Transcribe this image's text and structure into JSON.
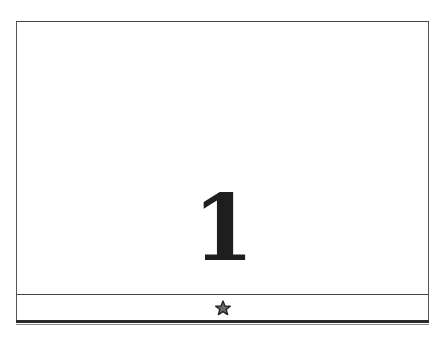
{
  "card": {
    "number": "1",
    "footer_icon": "star-icon"
  },
  "colors": {
    "border": "#444444",
    "number": "#1e1e1e",
    "star_fill": "#666666",
    "star_stroke": "#222222"
  }
}
